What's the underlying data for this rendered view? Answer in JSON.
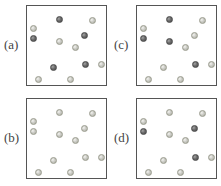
{
  "figure": {
    "colors": {
      "light_particle": "#c4c4bf",
      "dark_particle": "#666666",
      "border": "#555555"
    },
    "panels": [
      {
        "id": "a",
        "label": "(a)",
        "pos": [
          0,
          0
        ],
        "particles": [
          {
            "x": 3,
            "y": 19,
            "type": "light"
          },
          {
            "x": 29,
            "y": 10,
            "type": "dark"
          },
          {
            "x": 62,
            "y": 11,
            "type": "light"
          },
          {
            "x": 3,
            "y": 29,
            "type": "dark"
          },
          {
            "x": 29,
            "y": 32,
            "type": "light"
          },
          {
            "x": 54,
            "y": 26,
            "type": "dark"
          },
          {
            "x": 45,
            "y": 38,
            "type": "light"
          },
          {
            "x": 23,
            "y": 58,
            "type": "dark"
          },
          {
            "x": 55,
            "y": 55,
            "type": "dark"
          },
          {
            "x": 71,
            "y": 55,
            "type": "light"
          },
          {
            "x": 8,
            "y": 70,
            "type": "light"
          },
          {
            "x": 40,
            "y": 70,
            "type": "light"
          }
        ]
      },
      {
        "id": "c",
        "label": "(c)",
        "pos": [
          110,
          0
        ],
        "particles": [
          {
            "x": 3,
            "y": 19,
            "type": "light"
          },
          {
            "x": 29,
            "y": 10,
            "type": "dark"
          },
          {
            "x": 62,
            "y": 11,
            "type": "light"
          },
          {
            "x": 3,
            "y": 29,
            "type": "dark"
          },
          {
            "x": 29,
            "y": 32,
            "type": "dark"
          },
          {
            "x": 54,
            "y": 26,
            "type": "light"
          },
          {
            "x": 45,
            "y": 38,
            "type": "light"
          },
          {
            "x": 23,
            "y": 58,
            "type": "light"
          },
          {
            "x": 55,
            "y": 55,
            "type": "dark"
          },
          {
            "x": 71,
            "y": 55,
            "type": "light"
          },
          {
            "x": 8,
            "y": 70,
            "type": "light"
          },
          {
            "x": 40,
            "y": 70,
            "type": "light"
          }
        ]
      },
      {
        "id": "b",
        "label": "(b)",
        "pos": [
          0,
          93
        ],
        "particles": [
          {
            "x": 3,
            "y": 19,
            "type": "light"
          },
          {
            "x": 29,
            "y": 10,
            "type": "light"
          },
          {
            "x": 62,
            "y": 11,
            "type": "light"
          },
          {
            "x": 3,
            "y": 29,
            "type": "light"
          },
          {
            "x": 29,
            "y": 32,
            "type": "light"
          },
          {
            "x": 54,
            "y": 26,
            "type": "light"
          },
          {
            "x": 45,
            "y": 38,
            "type": "light"
          },
          {
            "x": 23,
            "y": 58,
            "type": "light"
          },
          {
            "x": 55,
            "y": 55,
            "type": "light"
          },
          {
            "x": 71,
            "y": 55,
            "type": "light"
          },
          {
            "x": 8,
            "y": 70,
            "type": "light"
          },
          {
            "x": 40,
            "y": 70,
            "type": "light"
          }
        ]
      },
      {
        "id": "d",
        "label": "(d)",
        "pos": [
          110,
          93
        ],
        "particles": [
          {
            "x": 3,
            "y": 19,
            "type": "light"
          },
          {
            "x": 29,
            "y": 10,
            "type": "light"
          },
          {
            "x": 62,
            "y": 11,
            "type": "light"
          },
          {
            "x": 3,
            "y": 29,
            "type": "dark"
          },
          {
            "x": 29,
            "y": 32,
            "type": "light"
          },
          {
            "x": 54,
            "y": 26,
            "type": "dark"
          },
          {
            "x": 45,
            "y": 38,
            "type": "light"
          },
          {
            "x": 23,
            "y": 58,
            "type": "light"
          },
          {
            "x": 55,
            "y": 55,
            "type": "dark"
          },
          {
            "x": 71,
            "y": 55,
            "type": "light"
          },
          {
            "x": 8,
            "y": 70,
            "type": "light"
          },
          {
            "x": 40,
            "y": 70,
            "type": "light"
          }
        ]
      }
    ]
  }
}
